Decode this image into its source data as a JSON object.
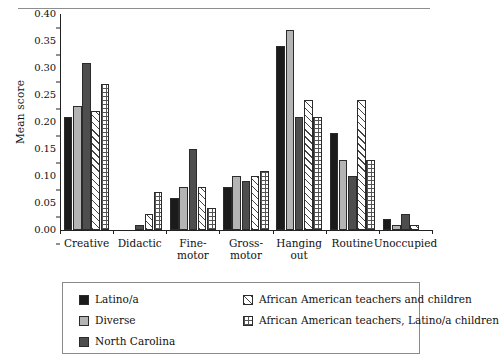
{
  "figure": {
    "clipped_caption": "",
    "y_axis_title": "Mean score"
  },
  "chart_data": {
    "type": "bar",
    "title": "",
    "xlabel": "",
    "ylabel": "Mean score",
    "ylim": [
      0,
      0.4
    ],
    "ytick_labels": [
      "0.00",
      "0.05",
      "0.10",
      "0.15",
      "0.20",
      "0.25",
      "0.30",
      "0.35",
      "0.40"
    ],
    "ytick_values": [
      0,
      0.05,
      0.1,
      0.15,
      0.2,
      0.25,
      0.3,
      0.35,
      0.4
    ],
    "grid": false,
    "legend_position": "bottom",
    "categories": [
      "Creative",
      "Didactic",
      "Fine-\nmotor",
      "Gross-\nmotor",
      "Hanging\nout",
      "Routine",
      "Unoccupied"
    ],
    "series": [
      {
        "name": "Latino/a",
        "fill": "solid-black",
        "color": "#1b1b1b",
        "values": [
          0.21,
          0.0,
          0.06,
          0.08,
          0.34,
          0.18,
          0.02
        ]
      },
      {
        "name": "Diverse",
        "fill": "solid-light-gray",
        "color": "#b4b4b4",
        "values": [
          0.23,
          0.0,
          0.08,
          0.1,
          0.37,
          0.13,
          0.01
        ]
      },
      {
        "name": "North Carolina",
        "fill": "solid-dark-gray",
        "color": "#4e4e4e",
        "values": [
          0.31,
          0.01,
          0.15,
          0.09,
          0.21,
          0.1,
          0.03
        ]
      },
      {
        "name": "African American teachers and children",
        "fill": "diagonal-hatch",
        "color": "#ffffff",
        "values": [
          0.22,
          0.03,
          0.08,
          0.1,
          0.24,
          0.24,
          0.01
        ]
      },
      {
        "name": "African American teachers, Latino/a children",
        "fill": "grid-dot-hatch",
        "color": "#ffffff",
        "values": [
          0.27,
          0.07,
          0.04,
          0.11,
          0.21,
          0.13,
          0.0
        ]
      }
    ]
  },
  "legend": {
    "entries": [
      {
        "label": "Latino/a"
      },
      {
        "label": "Diverse"
      },
      {
        "label": "North Carolina"
      },
      {
        "label": "African American teachers and children"
      },
      {
        "label": "African American teachers, Latino/a children"
      }
    ]
  }
}
